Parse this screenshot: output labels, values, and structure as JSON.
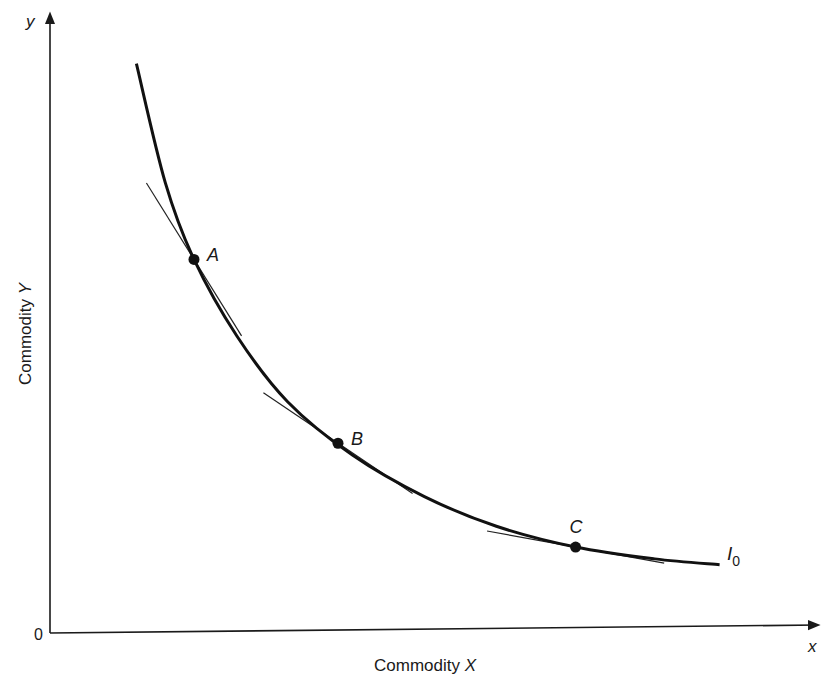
{
  "chart_data": {
    "type": "line",
    "title": "",
    "xlabel": "Commodity X",
    "xlabel_plain": "Commodity ",
    "xlabel_var": "X",
    "ylabel": "Commodity Y",
    "ylabel_plain": "Commodity ",
    "ylabel_var": "Y",
    "x_axis_end_label": "x",
    "y_axis_end_label": "y",
    "origin_label": "0",
    "xlim": [
      0,
      10
    ],
    "ylim": [
      0,
      10
    ],
    "grid": false,
    "curve": {
      "name": "I",
      "subscript": "0",
      "description": "indifference curve",
      "points": [
        [
          1.2,
          9.6
        ],
        [
          1.6,
          7.6
        ],
        [
          2.0,
          6.3
        ],
        [
          2.6,
          5.0
        ],
        [
          3.3,
          3.9
        ],
        [
          4.2,
          3.0
        ],
        [
          5.2,
          2.3
        ],
        [
          6.2,
          1.8
        ],
        [
          7.3,
          1.45
        ],
        [
          8.4,
          1.25
        ],
        [
          9.3,
          1.15
        ]
      ]
    },
    "points": [
      {
        "label": "A",
        "x": 2.0,
        "y": 6.3,
        "tangent_slope": -1.95
      },
      {
        "label": "B",
        "x": 4.0,
        "y": 3.2,
        "tangent_slope": -0.82
      },
      {
        "label": "C",
        "x": 7.3,
        "y": 1.45,
        "tangent_slope": -0.22
      }
    ]
  }
}
